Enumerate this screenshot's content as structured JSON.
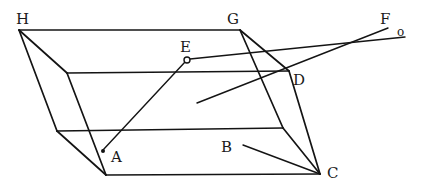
{
  "diagram": {
    "type": "geometric-figure",
    "labels": {
      "H": "H",
      "G": "G",
      "E": "E",
      "F": "F",
      "O": "o",
      "D": "D",
      "A": "A",
      "B": "B",
      "C": "C"
    },
    "colors": {
      "ink": "#141414",
      "background": "#ffffff"
    }
  }
}
